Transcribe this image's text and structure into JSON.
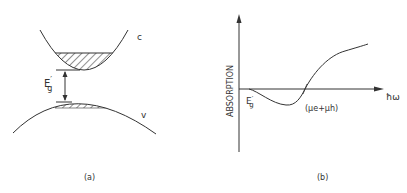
{
  "figure": {
    "panel_a": {
      "caption": "(a)",
      "conduction_band_label": "c",
      "valence_band_label": "v",
      "gap_label_main": "E",
      "gap_label_prime": "′",
      "gap_label_sub": "g"
    },
    "panel_b": {
      "caption": "(b)",
      "y_axis_label": "ABSORPTION",
      "x_axis_label": "ħω",
      "threshold_label_main": "E",
      "threshold_label_prime": "′",
      "threshold_label_sub": "g",
      "crossing_label": "(μe+μh)"
    },
    "colors": {
      "line": "#333333",
      "background": "#ffffff"
    }
  }
}
